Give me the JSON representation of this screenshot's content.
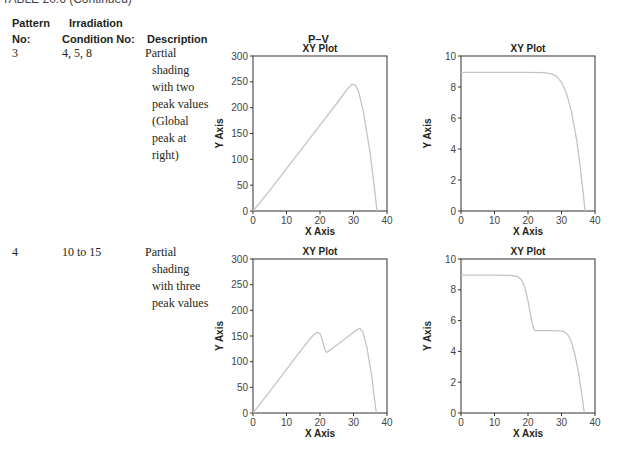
{
  "caption": "TABLE 20.6   (Continued)",
  "table": {
    "headers": {
      "pattern_line1": "Pattern",
      "pattern_line2": "No:",
      "irradiation_line1": "Irradiation",
      "irradiation_line2": "Condition No:",
      "description": "Description",
      "pv": "P–V"
    },
    "rows": [
      {
        "pattern": "3",
        "condition": "4, 5, 8",
        "description_lines": [
          "Partial",
          "shading",
          "with two",
          "peak values",
          "(Global",
          "peak at",
          "right)"
        ]
      },
      {
        "pattern": "4",
        "condition": "10 to 15",
        "description_lines": [
          "Partial",
          "shading",
          "with three",
          "peak values"
        ]
      }
    ]
  },
  "chart_data": [
    {
      "id": "pattern3-pv",
      "type": "line",
      "title": "XY Plot",
      "xlabel": "X Axis",
      "ylabel": "Y Axis",
      "xlim": [
        0,
        40
      ],
      "ylim": [
        0,
        300
      ],
      "xticks": [
        0,
        10,
        20,
        30,
        40
      ],
      "yticks": [
        0,
        50,
        100,
        150,
        200,
        250,
        300
      ],
      "grid": false,
      "x": [
        0,
        5,
        10,
        15,
        20,
        25,
        28,
        29.5,
        30.5,
        31.5,
        33,
        35,
        36.5,
        37
      ],
      "y": [
        0,
        40,
        82,
        124,
        166,
        208,
        235,
        245,
        244,
        232,
        190,
        110,
        30,
        0
      ]
    },
    {
      "id": "pattern3-iv",
      "type": "line",
      "title": "XY Plot",
      "xlabel": "X Axis",
      "ylabel": "Y Axis",
      "xlim": [
        0,
        40
      ],
      "ylim": [
        0,
        10
      ],
      "xticks": [
        0,
        10,
        20,
        30,
        40
      ],
      "yticks": [
        0,
        2,
        4,
        6,
        8,
        10
      ],
      "grid": false,
      "x": [
        0,
        10,
        20,
        25,
        27,
        28.5,
        30,
        31.5,
        33,
        34.5,
        35.5,
        36.5,
        37
      ],
      "y": [
        8.95,
        8.95,
        8.95,
        8.93,
        8.85,
        8.7,
        8.3,
        7.6,
        6.4,
        4.6,
        3.0,
        1.1,
        0
      ]
    },
    {
      "id": "pattern4-pv",
      "type": "line",
      "title": "XY Plot",
      "xlabel": "X Axis",
      "ylabel": "Y Axis",
      "xlim": [
        0,
        40
      ],
      "ylim": [
        0,
        300
      ],
      "xticks": [
        0,
        10,
        20,
        30,
        40
      ],
      "yticks": [
        0,
        50,
        100,
        150,
        200,
        250,
        300
      ],
      "grid": false,
      "x": [
        0,
        5,
        10,
        15,
        17.5,
        19,
        20,
        20.8,
        21.5,
        22,
        25,
        28,
        30.5,
        31.8,
        32.8,
        34,
        35.5,
        36.5,
        36.8
      ],
      "y": [
        0,
        42,
        85,
        128,
        148,
        157,
        155,
        140,
        122,
        118,
        132,
        147,
        160,
        165,
        158,
        128,
        70,
        15,
        0
      ]
    },
    {
      "id": "pattern4-iv",
      "type": "line",
      "title": "XY Plot",
      "xlabel": "X Axis",
      "ylabel": "Y Axis",
      "xlim": [
        0,
        40
      ],
      "ylim": [
        0,
        10
      ],
      "xticks": [
        0,
        10,
        20,
        30,
        40
      ],
      "yticks": [
        0,
        2,
        4,
        6,
        8,
        10
      ],
      "grid": false,
      "x": [
        0,
        10,
        15,
        17,
        18,
        19,
        20,
        20.8,
        21.5,
        22,
        26,
        30,
        31,
        32,
        33,
        34,
        35,
        36,
        36.8
      ],
      "y": [
        8.95,
        8.95,
        8.93,
        8.85,
        8.65,
        8.2,
        7.3,
        6.3,
        5.6,
        5.35,
        5.35,
        5.33,
        5.25,
        5.05,
        4.6,
        3.8,
        2.7,
        1.3,
        0
      ]
    }
  ],
  "style": {
    "curve_color": "#c4c4c4",
    "axis_color": "#333333",
    "text_color": "#231f20"
  }
}
